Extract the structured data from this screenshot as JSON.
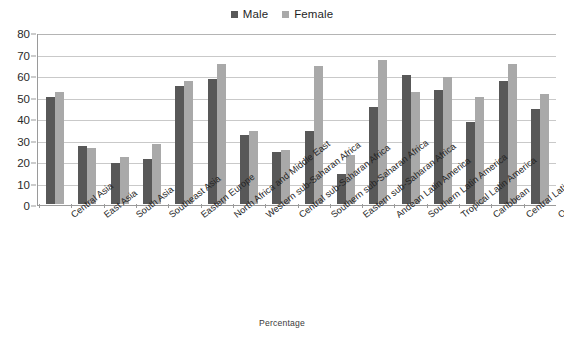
{
  "chart_data": {
    "type": "bar",
    "title": "",
    "xlabel": "Percentage",
    "ylabel": "",
    "ylim": [
      0,
      80
    ],
    "yticks": [
      0,
      10,
      20,
      30,
      40,
      50,
      60,
      70,
      80
    ],
    "grid": true,
    "legend_position": "top-center",
    "categories": [
      "Central Asia",
      "East Asia",
      "South Asia",
      "Southeast Asia",
      "Eastern Europe",
      "North Africa and Middle East",
      "Western sub-Saharan Africa",
      "Central sub-Saharan Africa",
      "Southern sub-Saharan Africa",
      "Eastern sub-Saharan Africa",
      "Andean Latin America",
      "Southern Latin America",
      "Tropical Latin America",
      "Caribbean",
      "Central Latin America",
      "Oceania"
    ],
    "series": [
      {
        "name": "Male",
        "color": "#585858",
        "values": [
          50,
          27,
          19,
          21,
          55,
          58,
          32,
          24,
          34,
          14,
          45,
          60,
          53,
          38,
          57,
          44
        ]
      },
      {
        "name": "Female",
        "color": "#a9a9a9",
        "values": [
          52,
          26,
          22,
          28,
          57,
          65,
          34,
          25,
          64,
          23,
          67,
          52,
          59,
          50,
          65,
          51
        ]
      }
    ]
  },
  "legend": {
    "entries": [
      {
        "label": "Male",
        "color": "#585858"
      },
      {
        "label": "Female",
        "color": "#a9a9a9"
      }
    ]
  },
  "axis": {
    "x_title": "Percentage"
  }
}
